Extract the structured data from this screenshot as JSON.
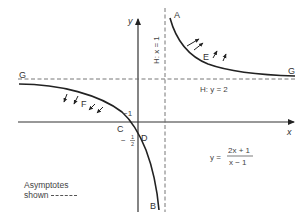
{
  "diagram": {
    "equation": {
      "lhs": "y =",
      "numerator": "2x + 1",
      "denominator": "x − 1"
    },
    "axes": {
      "x_label": "x",
      "y_label": "y"
    },
    "asymptotes": {
      "vertical_label": "H: x = 1",
      "horizontal_label": "H: y = 2"
    },
    "points": {
      "A": "A",
      "B": "B",
      "C": "C",
      "D": "D",
      "E": "E",
      "F": "F",
      "G_left": "G",
      "G_right": "G"
    },
    "intercepts": {
      "x_intercept": "−1",
      "y_intercept_sign": "−",
      "y_intercept_num": "1",
      "y_intercept_den": "2"
    },
    "legend": {
      "line1": "Asymptotes",
      "line2": "shown"
    },
    "colors": {
      "curve": "#222222",
      "axis": "#333333",
      "asymptote": "#666666",
      "background": "#ffffff"
    }
  }
}
